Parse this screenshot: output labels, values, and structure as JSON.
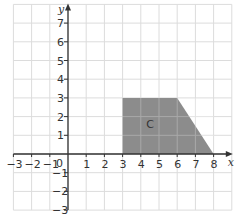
{
  "diagram": {
    "type": "coordinate-grid",
    "x_axis": {
      "label": "x",
      "min": -3,
      "max": 8,
      "ticks": [
        -3,
        -2,
        -1,
        1,
        2,
        3,
        4,
        5,
        6,
        7,
        8
      ]
    },
    "y_axis": {
      "label": "y",
      "min": -3,
      "max": 7,
      "ticks": [
        -3,
        -2,
        -1,
        1,
        2,
        3,
        4,
        5,
        6,
        7
      ]
    },
    "origin_label": "0",
    "shapes": [
      {
        "label": "C",
        "vertices": [
          [
            3,
            0
          ],
          [
            3,
            3
          ],
          [
            6,
            3
          ],
          [
            8,
            0
          ]
        ],
        "fill": "#8c8c8c"
      }
    ],
    "colors": {
      "grid": "#dcdcdc",
      "axis": "#333333",
      "shape_fill": "#8c8c8c",
      "text": "#333333"
    }
  }
}
